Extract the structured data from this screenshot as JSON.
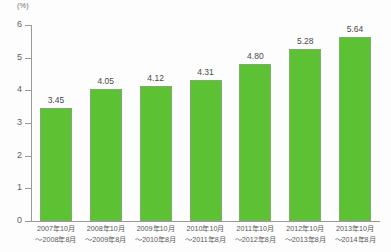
{
  "chart_data": {
    "type": "bar",
    "title": "",
    "subtitle": "",
    "xlabel": "",
    "ylabel": "",
    "unit_label": "(%)",
    "ylim": [
      0,
      6
    ],
    "ytick_labels": [
      "6",
      "5",
      "4",
      "3",
      "2",
      "1",
      "0"
    ],
    "ytick_values": [
      6,
      5,
      4,
      3,
      2,
      1,
      0
    ],
    "grid": false,
    "legend": false,
    "legend_position": "none",
    "bar_color": "#5cc234",
    "bar_border_color": "#7fae6a",
    "value_label_color": "#4a4a4a",
    "axis_color": "#9a9a9a",
    "categories": [
      "2007年10月〜2008年8月",
      "2008年10月〜2009年8月",
      "2009年10月〜2010年8月",
      "2010年10月〜2011年8月",
      "2011年10月〜2012年8月",
      "2012年10月〜2013年8月",
      "2013年10月〜2014年8月"
    ],
    "category_lines": [
      {
        "line1": "2007年10月",
        "line2": "〜2008年8月"
      },
      {
        "line1": "2008年10月",
        "line2": "〜2009年8月"
      },
      {
        "line1": "2009年10月",
        "line2": "〜2010年8月"
      },
      {
        "line1": "2010年10月",
        "line2": "〜2011年8月"
      },
      {
        "line1": "2011年10月",
        "line2": "〜2012年8月"
      },
      {
        "line1": "2012年10月",
        "line2": "〜2013年8月"
      },
      {
        "line1": "2013年10月",
        "line2": "〜2014年8月"
      }
    ],
    "values": [
      3.45,
      4.05,
      4.12,
      4.31,
      4.8,
      5.28,
      5.64
    ],
    "value_labels": [
      "3.45",
      "4.05",
      "4.12",
      "4.31",
      "4.80",
      "5.28",
      "5.64"
    ]
  }
}
